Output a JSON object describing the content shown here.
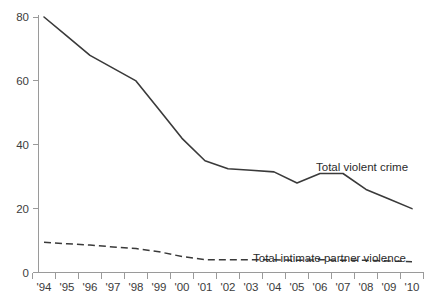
{
  "chart_data": {
    "type": "line",
    "title": "",
    "subtitle": "",
    "xlabel": "",
    "ylabel": "",
    "xlim": [
      1994,
      2010
    ],
    "ylim": [
      0,
      80
    ],
    "grid": false,
    "legend_position": "inline-right",
    "x": [
      1994,
      1995,
      1996,
      1997,
      1998,
      1999,
      2000,
      2001,
      2002,
      2003,
      2004,
      2005,
      2006,
      2007,
      2008,
      2009,
      2010
    ],
    "xtick_labels": [
      "'94",
      "'95",
      "'96",
      "'97",
      "'98",
      "'99",
      "'00",
      "'01",
      "'02",
      "'03",
      "'04",
      "'05",
      "'06",
      "'07",
      "'08",
      "'09",
      "'10"
    ],
    "ytick_values": [
      0,
      20,
      40,
      60,
      80
    ],
    "ytick_labels": [
      "0",
      "20",
      "40",
      "60",
      "80"
    ],
    "series": [
      {
        "name": "Total violent crime",
        "style": "solid",
        "color": "#3a3a3a",
        "label_x": 2006.0,
        "label_y": 40.0,
        "values": [
          80,
          74,
          68,
          64,
          60,
          51,
          42,
          35,
          32.5,
          32,
          31.5,
          28,
          31,
          31,
          26,
          23,
          20
        ]
      },
      {
        "name": "Total intimate partner violence",
        "style": "dashed",
        "color": "#3a3a3a",
        "label_x": 2002.7,
        "label_y": 10.5,
        "values": [
          9.5,
          9,
          8.6,
          8,
          7.5,
          6.5,
          5,
          4,
          4,
          4,
          4,
          3.8,
          4,
          3.8,
          3.8,
          3.6,
          3.4
        ]
      }
    ]
  }
}
